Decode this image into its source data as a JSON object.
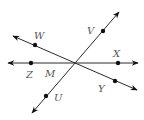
{
  "diagram": {
    "title": "",
    "intersection": {
      "label": "M",
      "x": 75,
      "y": 63
    },
    "lines": [
      {
        "name": "line-zx",
        "from": [
          8,
          63
        ],
        "to": [
          138,
          63
        ],
        "arrows": "both"
      },
      {
        "name": "line-wy",
        "from": [
          13,
          36
        ],
        "to": [
          137,
          90
        ],
        "arrows": "both"
      },
      {
        "name": "line-vu",
        "from": [
          119,
          12
        ],
        "to": [
          32,
          113
        ],
        "arrows": "both"
      }
    ],
    "points": [
      {
        "label": "W",
        "x": 35,
        "y": 45,
        "label_x": 34,
        "label_y": 39
      },
      {
        "label": "V",
        "x": 103,
        "y": 31,
        "label_x": 88,
        "label_y": 34
      },
      {
        "label": "X",
        "x": 118,
        "y": 63,
        "label_x": 114,
        "label_y": 57
      },
      {
        "label": "Z",
        "x": 31,
        "y": 63,
        "label_x": 26,
        "label_y": 77
      },
      {
        "label": "Y",
        "x": 115,
        "y": 81,
        "label_x": 98,
        "label_y": 92
      },
      {
        "label": "U",
        "x": 46,
        "y": 96,
        "label_x": 54,
        "label_y": 101
      }
    ],
    "labels": {
      "W": "W",
      "V": "V",
      "X": "X",
      "Z": "Z",
      "M": "M",
      "Y": "Y",
      "U": "U"
    },
    "colors": {
      "line": "#2a2a2a",
      "point": "#111111",
      "label": "#555555",
      "background": "#ffffff"
    }
  }
}
